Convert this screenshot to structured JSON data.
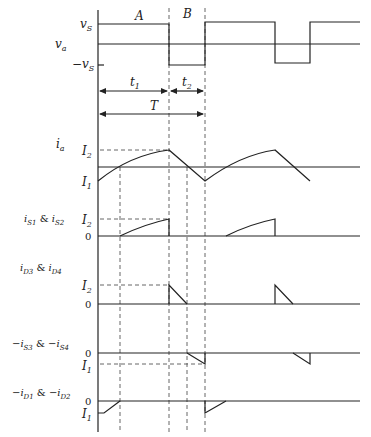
{
  "diagram": {
    "regions": {
      "a": "A",
      "b": "B"
    },
    "intervals": {
      "t1": "t",
      "t1_sub": "1",
      "t2": "t",
      "t2_sub": "2",
      "period": "T"
    },
    "signals": {
      "va": {
        "name": "v",
        "sub": "a",
        "high": "v",
        "high_sub": "S",
        "low": "−v",
        "low_sub": "S"
      },
      "ia": {
        "name": "i",
        "sub": "a",
        "top": "I",
        "top_sub": "2",
        "bottom": "I",
        "bottom_sub": "1"
      },
      "is": {
        "name": "i",
        "sub1": "S1",
        "amp": " & ",
        "name2": "i",
        "sub2": "S2",
        "top": "I",
        "top_sub": "2",
        "zero": "0"
      },
      "id": {
        "name": "i",
        "sub1": "D3",
        "amp": " & ",
        "name2": "i",
        "sub2": "D4",
        "top": "I",
        "top_sub": "2",
        "zero": "0"
      },
      "is34": {
        "name": "−i",
        "sub1": "S3",
        "amp": " & ",
        "name2": "−i",
        "sub2": "S4",
        "zero": "0",
        "bottom": "I",
        "bottom_sub": "1"
      },
      "id12": {
        "name": "−i",
        "sub1": "D1",
        "amp": " & ",
        "name2": "−i",
        "sub2": "D2",
        "zero": "0",
        "bottom": "I",
        "bottom_sub": "1"
      }
    },
    "colors": {
      "line": "#222222",
      "dash": "#555555",
      "background": "#ffffff"
    }
  }
}
